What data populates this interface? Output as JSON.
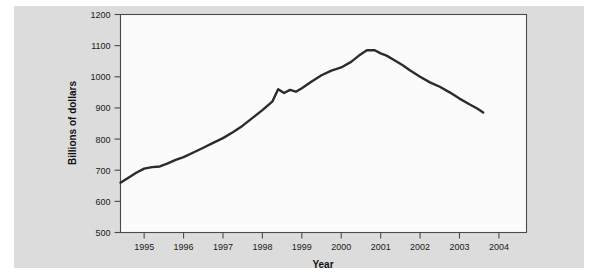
{
  "figure": {
    "background_color": "#dcdcdc",
    "plot_background_color": "#fbfbfb",
    "page_color": "#ffffff",
    "line_color": "#2b2b2b",
    "axis_color": "#4a4a4a"
  },
  "chart_data": {
    "type": "line",
    "title": "",
    "xlabel": "Year",
    "ylabel": "Billions of dollars",
    "xlim": [
      1994.4,
      2004.7
    ],
    "ylim": [
      500,
      1200
    ],
    "xticks": [
      1995,
      1996,
      1997,
      1998,
      1999,
      2000,
      2001,
      2002,
      2003,
      2004
    ],
    "xtick_labels": [
      "1995",
      "1996",
      "1997",
      "1998",
      "1999",
      "2000",
      "2001",
      "2002",
      "2003",
      "2004"
    ],
    "yticks": [
      500,
      600,
      700,
      800,
      900,
      1000,
      1100,
      1200
    ],
    "ytick_labels": [
      "500",
      "600",
      "700",
      "800",
      "900",
      "1000",
      "1100",
      "1200"
    ],
    "grid": false,
    "legend": null,
    "series": [
      {
        "name": "Billions of dollars",
        "x": [
          1994.4,
          1994.6,
          1994.8,
          1995.0,
          1995.2,
          1995.4,
          1995.6,
          1995.8,
          1996.0,
          1996.25,
          1996.5,
          1996.75,
          1997.0,
          1997.25,
          1997.5,
          1997.75,
          1998.0,
          1998.25,
          1998.4,
          1998.55,
          1998.7,
          1998.85,
          1999.0,
          1999.25,
          1999.5,
          1999.75,
          2000.0,
          2000.25,
          2000.45,
          2000.65,
          2000.85,
          2001.0,
          2001.15,
          2001.35,
          2001.55,
          2001.75,
          2002.0,
          2002.25,
          2002.5,
          2002.75,
          2003.0,
          2003.25,
          2003.45,
          2003.6
        ],
        "y": [
          660,
          676,
          692,
          705,
          710,
          712,
          722,
          733,
          742,
          757,
          772,
          788,
          803,
          822,
          843,
          868,
          893,
          920,
          960,
          948,
          958,
          952,
          963,
          985,
          1005,
          1020,
          1030,
          1048,
          1068,
          1085,
          1085,
          1075,
          1068,
          1053,
          1038,
          1020,
          1000,
          982,
          968,
          950,
          930,
          912,
          898,
          885
        ]
      }
    ],
    "peak": {
      "year": 2000.7,
      "value": 1086
    },
    "start": {
      "year": 1994.4,
      "value": 660
    },
    "end": {
      "year": 2003.6,
      "value": 885
    }
  }
}
